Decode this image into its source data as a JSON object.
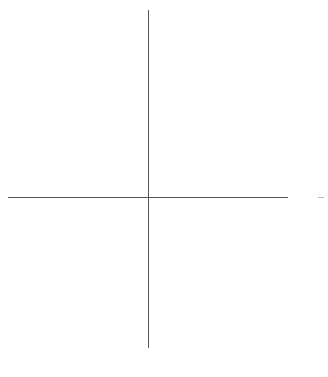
{
  "diagram": {
    "type": "coordinate-axes",
    "origin": {
      "x": 148,
      "y": 197
    },
    "vertical_axis": {
      "x": 148,
      "y_start": 10,
      "y_end": 348
    },
    "horizontal_axis": {
      "y": 197,
      "x_start": 8,
      "x_end": 288
    },
    "right_mark": {
      "x_start": 318,
      "x_end": 324,
      "y": 197
    },
    "colors": {
      "background": "#ffffff",
      "axis_line": "#555555",
      "faint_mark": "#bbbbbb"
    }
  }
}
